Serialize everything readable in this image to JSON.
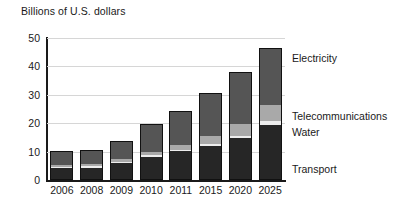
{
  "title": "Billions of U.S. dollars",
  "axis": {
    "y_ticks": [
      "0",
      "10",
      "20",
      "30",
      "40",
      "50"
    ],
    "x_ticks": [
      "2006",
      "2008",
      "2009",
      "2010",
      "2011",
      "2015",
      "2020",
      "2025"
    ]
  },
  "legend": {
    "electricity": "Electricity",
    "telecommunications": "Telecommunications",
    "water": "Water",
    "transport": "Transport"
  },
  "colors": {
    "transport": "#262626",
    "water": "#ededed",
    "telecommunications": "#a9a9a9",
    "electricity": "#555555",
    "gridline": "#d6d6d6",
    "axis": "#1a1a1a"
  },
  "chart_data": {
    "type": "bar",
    "stacked": true,
    "title": "Billions of U.S. dollars",
    "xlabel": "",
    "ylabel": "Billions of U.S. dollars",
    "ylim": [
      0,
      50
    ],
    "ytick_step": 10,
    "grid": true,
    "legend_position": "right-inline-annotations",
    "categories": [
      "2006",
      "2008",
      "2009",
      "2010",
      "2011",
      "2015",
      "2020",
      "2025"
    ],
    "series": [
      {
        "name": "Transport",
        "values": [
          4.2,
          4.3,
          6.0,
          8.0,
          10.0,
          11.8,
          14.6,
          19.3
        ]
      },
      {
        "name": "Water",
        "values": [
          0.5,
          0.5,
          0.5,
          0.6,
          0.7,
          0.8,
          1.0,
          1.6
        ]
      },
      {
        "name": "Telecommunications",
        "values": [
          0.6,
          0.7,
          1.0,
          1.2,
          1.5,
          2.8,
          4.2,
          5.5
        ]
      },
      {
        "name": "Electricity",
        "values": [
          5.0,
          5.0,
          6.2,
          9.9,
          12.2,
          15.1,
          18.2,
          20.1
        ]
      }
    ],
    "totals": [
      10.3,
      10.5,
      13.7,
      19.7,
      24.4,
      30.5,
      38.0,
      46.5
    ]
  }
}
